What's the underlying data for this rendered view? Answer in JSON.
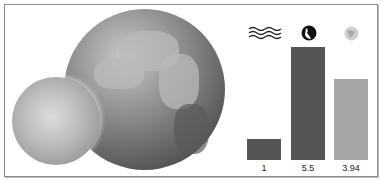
{
  "chart_data": {
    "type": "bar",
    "title": "",
    "categories": [
      "water",
      "earth",
      "moon"
    ],
    "category_icons": [
      "water-waves-icon",
      "earth-globe-icon",
      "moon-icon"
    ],
    "values": [
      1,
      5.5,
      3.94
    ],
    "value_labels": [
      "1",
      "5.5",
      "3.94"
    ],
    "colors": [
      "#555555",
      "#555555",
      "#a6a6a6"
    ],
    "xlabel": "",
    "ylabel": "",
    "ylim": [
      0,
      5.5
    ],
    "grid": false,
    "legend": "icons above bars"
  },
  "illustration": {
    "main": "earth-globe-image",
    "secondary": "moon-image"
  }
}
